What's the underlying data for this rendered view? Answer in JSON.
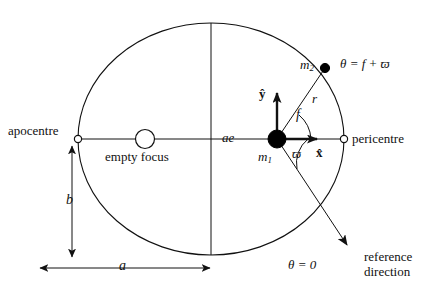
{
  "figure": {
    "type": "orbital-geometry-diagram",
    "stroke_color": "#111111",
    "background_color": "#ffffff",
    "body_fill_color": "#000000",
    "marker_fill_color": "#ffffff"
  },
  "labels": {
    "apocentre": "apocentre",
    "pericentre": "pericentre",
    "empty_focus": "empty focus",
    "semi_major_axis": "a",
    "semi_minor_axis": "b",
    "focal_distance": "ae",
    "primary_mass": "m",
    "primary_mass_sub": "1",
    "secondary_mass": "m",
    "secondary_mass_sub": "2",
    "radius": "r",
    "true_anomaly": "f",
    "longitude_of_pericentre": "ϖ",
    "unit_vector_x": "x̂",
    "unit_vector_y": "ŷ",
    "theta_equals_f_plus_varpi": "θ = f + ϖ",
    "theta_equals_zero": "θ = 0",
    "reference_direction_line1": "reference",
    "reference_direction_line2": "direction"
  },
  "geometry": {
    "ellipse_center_x": 211,
    "ellipse_center_y": 139,
    "ellipse_semi_major": 133,
    "ellipse_semi_minor": 116,
    "focus_primary_x": 277,
    "focus_primary_y": 139,
    "focus_empty_x": 145,
    "focus_empty_y": 139,
    "secondary_x": 325,
    "secondary_y": 68,
    "apocentre_x": 78,
    "apocentre_y": 139,
    "pericentre_x": 344,
    "pericentre_y": 139,
    "reference_arrow_tip_x": 352,
    "reference_arrow_tip_y": 250,
    "unit_x_arrow_tip_x": 321,
    "unit_x_arrow_tip_y": 139,
    "unit_y_arrow_tip_y": 91
  }
}
